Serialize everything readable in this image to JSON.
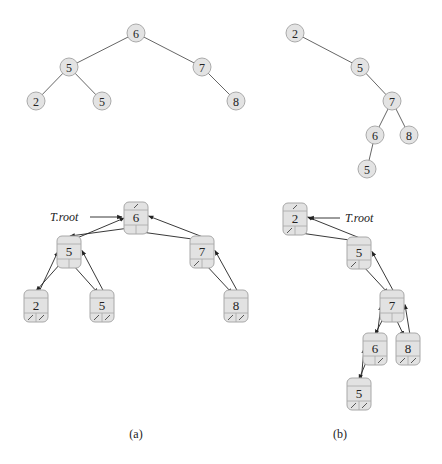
{
  "figure": {
    "panels": [
      {
        "label": "(a)",
        "tree": {
          "nodes": [
            {
              "id": "a6",
              "key": "6",
              "x": 136,
              "y": 33
            },
            {
              "id": "a5",
              "key": "5",
              "x": 69,
              "y": 67
            },
            {
              "id": "a7",
              "key": "7",
              "x": 202,
              "y": 67
            },
            {
              "id": "a2",
              "key": "2",
              "x": 36,
              "y": 101
            },
            {
              "id": "a5b",
              "key": "5",
              "x": 102,
              "y": 101
            },
            {
              "id": "a8",
              "key": "8",
              "x": 236,
              "y": 101
            }
          ],
          "edges": [
            [
              "a6",
              "a5"
            ],
            [
              "a6",
              "a7"
            ],
            [
              "a5",
              "a2"
            ],
            [
              "a5",
              "a5b"
            ],
            [
              "a7",
              "a8"
            ]
          ]
        },
        "linked": {
          "root_label": "T.root",
          "nodes": [
            {
              "id": "A6",
              "key": "6",
              "x": 124,
              "y": 202,
              "p_nil": true,
              "l_nil": false,
              "r_nil": false
            },
            {
              "id": "A5",
              "key": "5",
              "x": 57,
              "y": 236,
              "p_nil": false,
              "l_nil": false,
              "r_nil": false
            },
            {
              "id": "A7",
              "key": "7",
              "x": 190,
              "y": 236,
              "p_nil": false,
              "l_nil": true,
              "r_nil": false
            },
            {
              "id": "A2",
              "key": "2",
              "x": 24,
              "y": 290,
              "p_nil": false,
              "l_nil": true,
              "r_nil": true
            },
            {
              "id": "A5b",
              "key": "5",
              "x": 90,
              "y": 290,
              "p_nil": false,
              "l_nil": true,
              "r_nil": true
            },
            {
              "id": "A8",
              "key": "8",
              "x": 224,
              "y": 290,
              "p_nil": false,
              "l_nil": true,
              "r_nil": true
            }
          ]
        }
      },
      {
        "label": "(b)",
        "tree": {
          "nodes": [
            {
              "id": "b2",
              "key": "2",
              "x": 295,
              "y": 33
            },
            {
              "id": "b5",
              "key": "5",
              "x": 360,
              "y": 67
            },
            {
              "id": "b7",
              "key": "7",
              "x": 392,
              "y": 101
            },
            {
              "id": "b6",
              "key": "6",
              "x": 375,
              "y": 135
            },
            {
              "id": "b8",
              "key": "8",
              "x": 409,
              "y": 135
            },
            {
              "id": "b5b",
              "key": "5",
              "x": 367,
              "y": 169
            }
          ],
          "edges": [
            [
              "b2",
              "b5"
            ],
            [
              "b5",
              "b7"
            ],
            [
              "b7",
              "b6"
            ],
            [
              "b7",
              "b8"
            ],
            [
              "b6",
              "b5b"
            ]
          ]
        },
        "linked": {
          "root_label": "T.root",
          "nodes": [
            {
              "id": "B2",
              "key": "2",
              "x": 283,
              "y": 203,
              "p_nil": true,
              "l_nil": true,
              "r_nil": false
            },
            {
              "id": "B5",
              "key": "5",
              "x": 347,
              "y": 237,
              "p_nil": false,
              "l_nil": true,
              "r_nil": false
            },
            {
              "id": "B7",
              "key": "7",
              "x": 380,
              "y": 290,
              "p_nil": false,
              "l_nil": false,
              "r_nil": false
            },
            {
              "id": "B6",
              "key": "6",
              "x": 363,
              "y": 333,
              "p_nil": false,
              "l_nil": false,
              "r_nil": true
            },
            {
              "id": "B8",
              "key": "8",
              "x": 396,
              "y": 333,
              "p_nil": false,
              "l_nil": true,
              "r_nil": true
            },
            {
              "id": "B5b",
              "key": "5",
              "x": 347,
              "y": 378,
              "p_nil": false,
              "l_nil": true,
              "r_nil": true
            }
          ]
        }
      }
    ],
    "colors": {
      "node_fill": "#e2e2e2",
      "node_stroke": "#a8a8a8",
      "edge": "#555555"
    }
  }
}
